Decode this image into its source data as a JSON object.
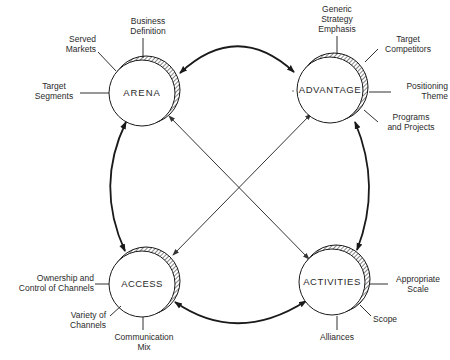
{
  "diagram": {
    "type": "strategy-framework",
    "nodes": [
      {
        "id": "arena",
        "label": "ARENA",
        "factors": [
          "Business Definition",
          "Served Markets",
          "Target Segments"
        ]
      },
      {
        "id": "advantage",
        "label": "ADVANTAGE",
        "factors": [
          "Generic Strategy Emphasis",
          "Target Competitors",
          "Positioning Theme",
          "Programs and Projects"
        ]
      },
      {
        "id": "access",
        "label": "ACCESS",
        "factors": [
          "Ownership and Control of Channels",
          "Variety of Channels",
          "Communication Mix"
        ]
      },
      {
        "id": "activities",
        "label": "ACTIVITIES",
        "factors": [
          "Appropriate Scale",
          "Scope",
          "Alliances"
        ]
      }
    ],
    "edges": [
      {
        "from": "arena",
        "to": "advantage",
        "style": "curved-bidirectional"
      },
      {
        "from": "advantage",
        "to": "activities",
        "style": "curved-bidirectional"
      },
      {
        "from": "activities",
        "to": "access",
        "style": "curved-bidirectional"
      },
      {
        "from": "access",
        "to": "arena",
        "style": "curved-bidirectional"
      },
      {
        "from": "arena",
        "to": "activities",
        "style": "straight-bidirectional"
      },
      {
        "from": "access",
        "to": "advantage",
        "style": "straight-bidirectional"
      }
    ]
  },
  "labels": {
    "arena": {
      "title": "ARENA",
      "business_definition_1": "Business",
      "business_definition_2": "Definition",
      "served_markets_1": "Served",
      "served_markets_2": "Markets",
      "target_segments_1": "Target",
      "target_segments_2": "Segments"
    },
    "advantage": {
      "title": "ADVANTAGE",
      "generic_1": "Generic",
      "generic_2": "Strategy",
      "generic_3": "Emphasis",
      "target_competitors_1": "Target",
      "target_competitors_2": "Competitors",
      "positioning_1": "Positioning",
      "positioning_2": "Theme",
      "programs_1": "Programs",
      "programs_2": "and Projects"
    },
    "access": {
      "title": "ACCESS",
      "ownership_1": "Ownership and",
      "ownership_2": "Control of Channels",
      "variety_1": "Variety of",
      "variety_2": "Channels",
      "communication_1": "Communication",
      "communication_2": "Mix"
    },
    "activities": {
      "title": "ACTIVITIES",
      "scale_1": "Appropriate",
      "scale_2": "Scale",
      "scope": "Scope",
      "alliances": "Alliances"
    }
  },
  "colors": {
    "line": "#1a1a1a",
    "text": "#2a2a2a",
    "background": "#ffffff"
  }
}
